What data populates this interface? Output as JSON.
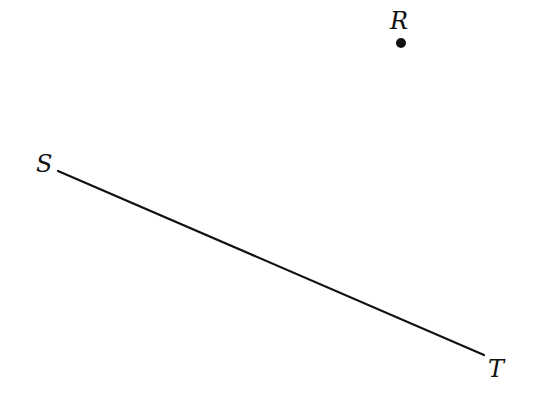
{
  "diagram": {
    "points": [
      {
        "label": "R",
        "x": 401,
        "y": 43,
        "label_x": 390,
        "label_y": 29
      },
      {
        "label": "S",
        "x": 58,
        "y": 171,
        "label_x": 36,
        "label_y": 172
      },
      {
        "label": "T",
        "x": 484,
        "y": 355,
        "label_x": 488,
        "label_y": 377
      }
    ],
    "segments": [
      {
        "from": "S",
        "to": "T"
      }
    ],
    "colors": {
      "stroke": "#111111",
      "background": "#ffffff"
    }
  }
}
